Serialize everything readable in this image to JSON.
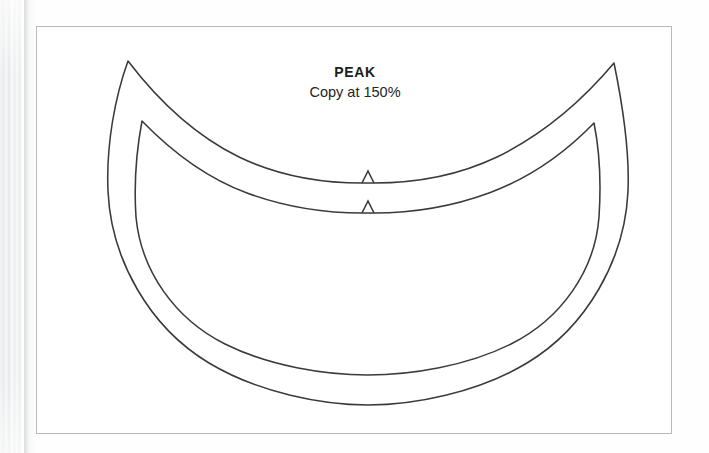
{
  "document": {
    "type": "scanned-book-page",
    "medium": "sewing pattern sheet",
    "background_color": "#ffffff",
    "page_edge_color": "#e9eaec"
  },
  "frame": {
    "name": "pattern-frame",
    "border_color": "#b9babd",
    "x": 36,
    "y": 26,
    "width": 636,
    "height": 408
  },
  "labels": {
    "title": "PEAK",
    "instruction": "Copy at 150%"
  },
  "pattern": {
    "stroke_color": "#3a3a3c",
    "stroke_width": 1.55,
    "pieces": [
      {
        "name": "outer-peak-outline",
        "description": "Large crescent brim piece with pointed tips and a centre notch",
        "left_tip": [
          91,
          34
        ],
        "right_tip": [
          577,
          36
        ],
        "leftmost_x": 69,
        "rightmost_x": 592,
        "bottom_y": 357,
        "notch_center_x": 331,
        "notch_apex_y": 144,
        "notch_base_y": 156
      },
      {
        "name": "inner-peak-outline",
        "description": "Smaller concentric crescent brim piece with a centre notch",
        "left_tip": [
          105,
          94
        ],
        "right_tip": [
          561,
          96
        ],
        "leftmost_x": 98,
        "rightmost_x": 556,
        "bottom_y": 332,
        "notch_center_x": 331,
        "notch_apex_y": 174,
        "notch_base_y": 186
      }
    ],
    "notch": {
      "name": "centre-balance-notch",
      "shape": "triangle",
      "count": 2,
      "half_width": 6,
      "height": 12
    }
  }
}
